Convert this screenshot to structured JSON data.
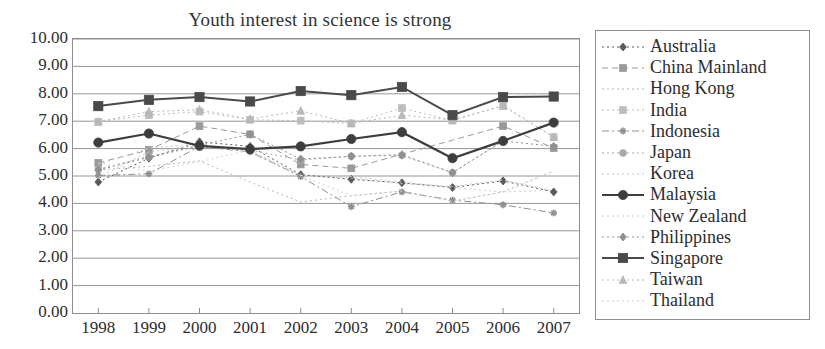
{
  "chart_data": {
    "type": "line",
    "title": "Youth interest in science is strong",
    "xlabel": "",
    "ylabel": "",
    "ylim": [
      0,
      10
    ],
    "ytick_step": 1,
    "ytick_labels": [
      "10.00",
      "9.00",
      "8.00",
      "7.00",
      "6.00",
      "5.00",
      "4.00",
      "3.00",
      "2.00",
      "1.00",
      "0.00"
    ],
    "grid": "horizontal",
    "legend_position": "right",
    "categories": [
      "1998",
      "1999",
      "2000",
      "2001",
      "2002",
      "2003",
      "2004",
      "2005",
      "2006",
      "2007"
    ],
    "series": [
      {
        "name": "Australia",
        "marker": "diamond",
        "color": "#5a5a5a",
        "line": "dotted",
        "width": 1,
        "values": [
          4.78,
          5.65,
          6.25,
          6.08,
          5.05,
          4.88,
          4.75,
          4.58,
          4.82,
          4.42
        ]
      },
      {
        "name": "China Mainland",
        "marker": "square",
        "color": "#9a9a9a",
        "line": "dashed",
        "width": 1,
        "values": [
          5.48,
          5.95,
          6.82,
          6.52,
          5.42,
          5.28,
          null,
          null,
          6.82,
          6.02
        ]
      },
      {
        "name": "Hong Kong",
        "marker": "none",
        "color": "#b5b5b5",
        "line": "dotted",
        "width": 1,
        "values": [
          5.22,
          5.35,
          5.55,
          4.78,
          4.05,
          4.28,
          4.45,
          4.08,
          4.42,
          5.18
        ]
      },
      {
        "name": "India",
        "marker": "square",
        "color": "#bdbdbd",
        "line": "dotted",
        "width": 1,
        "values": [
          6.98,
          7.22,
          7.35,
          7.05,
          7.02,
          6.92,
          7.48,
          7.02,
          7.58,
          6.42
        ]
      },
      {
        "name": "Indonesia",
        "marker": "star",
        "color": "#8f8f8f",
        "line": "dashdot",
        "width": 1,
        "values": [
          5.02,
          5.08,
          6.08,
          5.88,
          4.98,
          3.88,
          4.42,
          4.12,
          3.95,
          3.65
        ]
      },
      {
        "name": "Japan",
        "marker": "circle",
        "color": "#a8a8a8",
        "line": "dotted",
        "width": 1,
        "values": [
          5.25,
          5.72,
          6.08,
          5.95,
          5.58,
          5.72,
          5.75,
          5.12,
          6.28,
          6.95
        ]
      },
      {
        "name": "Korea",
        "marker": "none",
        "color": "#c4c4c4",
        "line": "dotted",
        "width": 1,
        "values": [
          4.95,
          5.88,
          6.12,
          5.92,
          5.02,
          4.92,
          4.72,
          4.62,
          4.85,
          4.45
        ]
      },
      {
        "name": "Malaysia",
        "marker": "circle",
        "color": "#3d3d3d",
        "line": "solid",
        "width": 2.2,
        "values": [
          6.22,
          6.55,
          6.1,
          5.98,
          6.08,
          6.35,
          6.6,
          5.65,
          6.28,
          6.95
        ]
      },
      {
        "name": "New Zealand",
        "marker": "none",
        "color": "#cccccc",
        "line": "dotted",
        "width": 1,
        "values": [
          5.42,
          6.02,
          6.18,
          5.85,
          5.02,
          4.98,
          4.78,
          4.58,
          4.42,
          4.48
        ]
      },
      {
        "name": "Philippines",
        "marker": "diamond",
        "color": "#909090",
        "line": "dotted",
        "width": 1,
        "values": [
          5.22,
          5.68,
          6.12,
          6.52,
          5.62,
          5.72,
          5.78,
          5.12,
          6.28,
          6.08
        ]
      },
      {
        "name": "Singapore",
        "marker": "square",
        "color": "#4a4a4a",
        "line": "solid",
        "width": 2.0,
        "values": [
          7.55,
          7.78,
          7.88,
          7.72,
          8.1,
          7.95,
          8.25,
          7.22,
          7.88,
          7.9
        ]
      },
      {
        "name": "Taiwan",
        "marker": "triangle",
        "color": "#b8b8b8",
        "line": "dotted",
        "width": 1,
        "values": [
          6.98,
          7.35,
          7.42,
          7.08,
          7.38,
          6.92,
          7.22,
          7.05,
          7.55,
          6.42
        ]
      },
      {
        "name": "Thailand",
        "marker": "none",
        "color": "#d2d2d2",
        "line": "dotted",
        "width": 1,
        "values": [
          5.48,
          5.18,
          5.52,
          5.95,
          5.02,
          4.28,
          4.45,
          4.08,
          4.42,
          5.18
        ]
      }
    ]
  },
  "legend": {
    "items": [
      "Australia",
      "China Mainland",
      "Hong Kong",
      "India",
      "Indonesia",
      "Japan",
      "Korea",
      "Malaysia",
      "New Zealand",
      "Philippines",
      "Singapore",
      "Taiwan",
      "Thailand"
    ]
  }
}
